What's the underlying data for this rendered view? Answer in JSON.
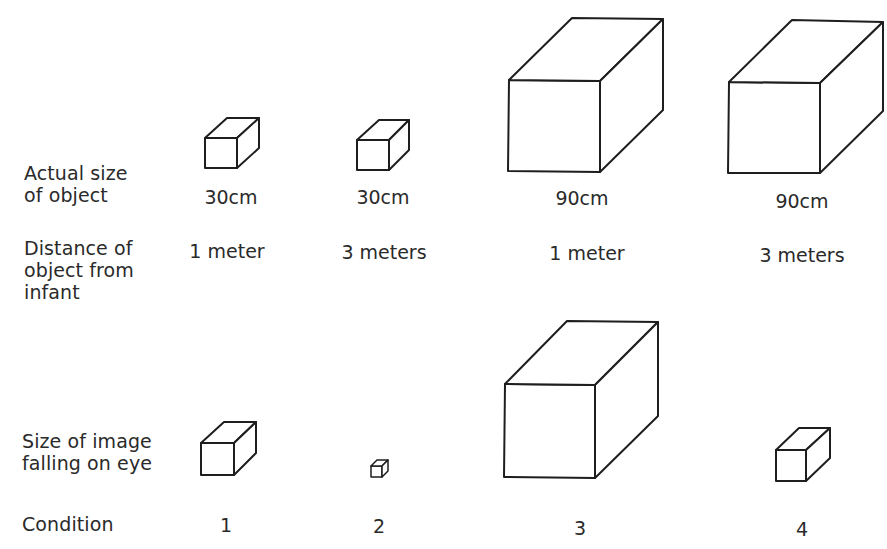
{
  "row_labels": {
    "actual_size": "Actual size\nof object",
    "distance": "Distance of\nobject from\ninfant",
    "image_size": "Size of image\nfalling on eye",
    "condition": "Condition"
  },
  "conditions": [
    {
      "id": "1",
      "actual_size": "30cm",
      "distance": "1 meter",
      "image_size": "large-small (same as 30cm at 1m)"
    },
    {
      "id": "2",
      "actual_size": "30cm",
      "distance": "3 meters",
      "image_size": "tiny"
    },
    {
      "id": "3",
      "actual_size": "90cm",
      "distance": "1 meter",
      "image_size": "very large"
    },
    {
      "id": "4",
      "actual_size": "90cm",
      "distance": "3 meters",
      "image_size": "small"
    }
  ],
  "colors": {
    "stroke": "#1e1e1e",
    "text": "#2a2a2a",
    "background": "#ffffff"
  }
}
